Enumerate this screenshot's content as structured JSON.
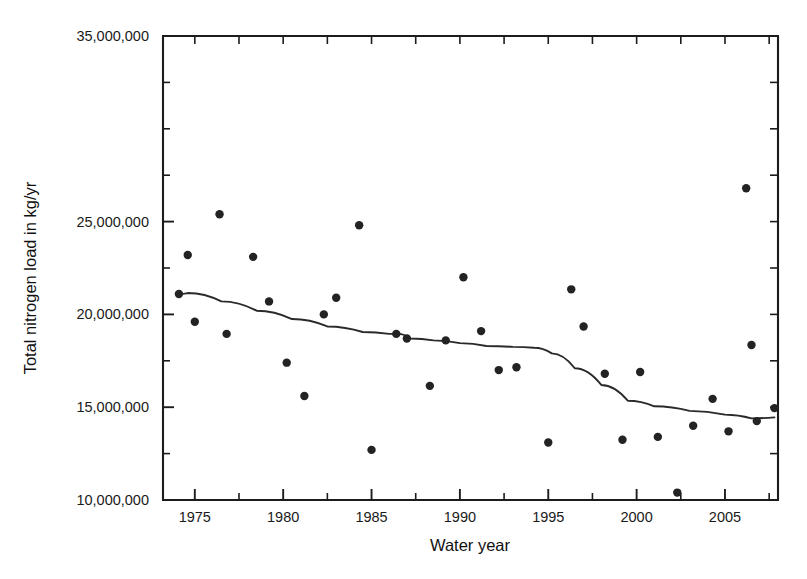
{
  "chart_data": {
    "type": "scatter",
    "title": "",
    "xlabel": "Water year",
    "ylabel": "Total nitrogen load in kg/yr",
    "xlim": [
      1973.2,
      2008.0
    ],
    "ylim": [
      10000000,
      35000000
    ],
    "grid": false,
    "legend": null,
    "x_ticks_major": [
      1975,
      1980,
      1985,
      1990,
      1995,
      2000,
      2005
    ],
    "x_tick_labels": [
      "1975",
      "1980",
      "1985",
      "1990",
      "1995",
      "2000",
      "2005"
    ],
    "x_ticks_minor": [
      1977.5,
      1982.5,
      1987.5,
      1992.5,
      1997.5,
      2002.5,
      2007.5
    ],
    "y_ticks_major": [
      10000000,
      15000000,
      20000000,
      25000000,
      35000000
    ],
    "y_tick_labels": [
      "10,000,000",
      "15,000,000",
      "20,000,000",
      "25,000,000",
      "35,000,000"
    ],
    "y_ticks_minor": [
      12500000,
      17500000,
      22500000,
      27500000,
      30000000,
      32500000
    ],
    "points": [
      {
        "x": 1974.1,
        "y": 21100000
      },
      {
        "x": 1974.6,
        "y": 23200000
      },
      {
        "x": 1975.0,
        "y": 19600000
      },
      {
        "x": 1976.4,
        "y": 25400000
      },
      {
        "x": 1976.8,
        "y": 18950000
      },
      {
        "x": 1978.3,
        "y": 23100000
      },
      {
        "x": 1979.2,
        "y": 20700000
      },
      {
        "x": 1980.2,
        "y": 17400000
      },
      {
        "x": 1981.2,
        "y": 15600000
      },
      {
        "x": 1982.3,
        "y": 20000000
      },
      {
        "x": 1983.0,
        "y": 20900000
      },
      {
        "x": 1984.3,
        "y": 24800000
      },
      {
        "x": 1985.0,
        "y": 12700000
      },
      {
        "x": 1986.4,
        "y": 18950000
      },
      {
        "x": 1987.0,
        "y": 18700000
      },
      {
        "x": 1988.3,
        "y": 16150000
      },
      {
        "x": 1989.2,
        "y": 18600000
      },
      {
        "x": 1990.2,
        "y": 22000000
      },
      {
        "x": 1991.2,
        "y": 19100000
      },
      {
        "x": 1992.2,
        "y": 17000000
      },
      {
        "x": 1993.2,
        "y": 17150000
      },
      {
        "x": 1995.0,
        "y": 13100000
      },
      {
        "x": 1996.3,
        "y": 21350000
      },
      {
        "x": 1997.0,
        "y": 19350000
      },
      {
        "x": 1998.2,
        "y": 16800000
      },
      {
        "x": 1999.2,
        "y": 13250000
      },
      {
        "x": 2000.2,
        "y": 16900000
      },
      {
        "x": 2001.2,
        "y": 13400000
      },
      {
        "x": 2002.3,
        "y": 10400000
      },
      {
        "x": 2003.2,
        "y": 14000000
      },
      {
        "x": 2004.3,
        "y": 15450000
      },
      {
        "x": 2005.2,
        "y": 13700000
      },
      {
        "x": 2006.2,
        "y": 26800000
      },
      {
        "x": 2006.5,
        "y": 18350000
      },
      {
        "x": 2006.8,
        "y": 14250000
      },
      {
        "x": 2007.8,
        "y": 14950000
      }
    ],
    "trend": [
      {
        "x": 1974.1,
        "y": 21100000
      },
      {
        "x": 1974.6,
        "y": 21150000
      },
      {
        "x": 1976.5,
        "y": 20700000
      },
      {
        "x": 1978.5,
        "y": 20200000
      },
      {
        "x": 1980.5,
        "y": 19750000
      },
      {
        "x": 1982.5,
        "y": 19350000
      },
      {
        "x": 1984.5,
        "y": 19050000
      },
      {
        "x": 1986.0,
        "y": 18950000
      },
      {
        "x": 1986.5,
        "y": 18950000
      },
      {
        "x": 1987.2,
        "y": 18700000
      },
      {
        "x": 1988.5,
        "y": 18600000
      },
      {
        "x": 1990.0,
        "y": 18450000
      },
      {
        "x": 1991.5,
        "y": 18300000
      },
      {
        "x": 1993.0,
        "y": 18250000
      },
      {
        "x": 1994.2,
        "y": 18200000
      },
      {
        "x": 1995.2,
        "y": 17900000
      },
      {
        "x": 1996.5,
        "y": 17100000
      },
      {
        "x": 1998.0,
        "y": 16200000
      },
      {
        "x": 1999.5,
        "y": 15350000
      },
      {
        "x": 2001.0,
        "y": 15050000
      },
      {
        "x": 2003.0,
        "y": 14800000
      },
      {
        "x": 2005.0,
        "y": 14600000
      },
      {
        "x": 2006.5,
        "y": 14400000
      },
      {
        "x": 2007.8,
        "y": 14450000
      }
    ],
    "marker_radius": 4.2,
    "colors": {
      "marker": "#232323",
      "line": "#2a2a2a",
      "axis": "#1c1c1c",
      "background": "#ffffff"
    }
  }
}
